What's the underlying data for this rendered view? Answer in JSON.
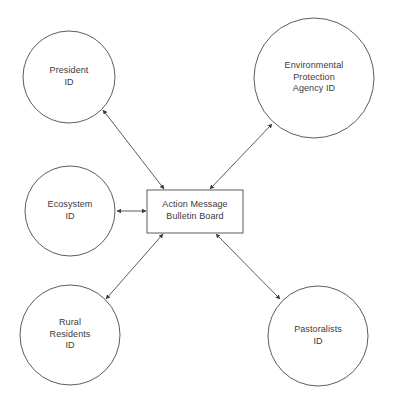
{
  "diagram": {
    "background_color": "#ffffff",
    "stroke_color": "#4a4a4a",
    "text_color": "#3a3a3a",
    "center_node": {
      "id": "action-message-bulletin-board",
      "shape": "rectangle",
      "lines": [
        "Action Message",
        "Bulletin Board"
      ],
      "line1": "Action Message",
      "line2": "Bulletin Board",
      "x": 147,
      "y": 190,
      "width": 96,
      "height": 43
    },
    "nodes": [
      {
        "id": "president-id",
        "shape": "circle",
        "lines": [
          "President",
          "ID"
        ],
        "line1": "President",
        "line2": "ID",
        "cx": 69,
        "cy": 77,
        "r": 46
      },
      {
        "id": "environmental-protection-agency-id",
        "shape": "circle",
        "lines": [
          "Environmental",
          "Protection",
          "Agency ID"
        ],
        "line1": "Environmental",
        "line2": "Protection",
        "line3": "Agency ID",
        "cx": 314,
        "cy": 78,
        "r": 60
      },
      {
        "id": "ecosystem-id",
        "shape": "circle",
        "lines": [
          "Ecosystem",
          "ID"
        ],
        "line1": "Ecosystem",
        "line2": "ID",
        "cx": 70,
        "cy": 211,
        "r": 45
      },
      {
        "id": "rural-residents-id",
        "shape": "circle",
        "lines": [
          "Rural",
          "Residents",
          "ID"
        ],
        "line1": "Rural",
        "line2": "Residents",
        "line3": "ID",
        "cx": 70,
        "cy": 335,
        "r": 50
      },
      {
        "id": "pastoralists-id",
        "shape": "circle",
        "lines": [
          "Pastoralists",
          "ID"
        ],
        "line1": "Pastoralists",
        "line2": "ID",
        "cx": 318,
        "cy": 336,
        "r": 50
      }
    ],
    "connectors": [
      {
        "id": "president-to-board",
        "from": "president-id",
        "to": "action-message-bulletin-board",
        "direction": "bidirectional",
        "x1": 103,
        "y1": 110,
        "x2": 164,
        "y2": 189
      },
      {
        "id": "epa-to-board",
        "from": "environmental-protection-agency-id",
        "to": "action-message-bulletin-board",
        "direction": "bidirectional",
        "x1": 272,
        "y1": 124,
        "x2": 210,
        "y2": 189
      },
      {
        "id": "ecosystem-to-board",
        "from": "ecosystem-id",
        "to": "action-message-bulletin-board",
        "direction": "bidirectional",
        "x1": 116,
        "y1": 211,
        "x2": 146,
        "y2": 211
      },
      {
        "id": "rural-residents-to-board",
        "from": "rural-residents-id",
        "to": "action-message-bulletin-board",
        "direction": "bidirectional",
        "x1": 106,
        "y1": 299,
        "x2": 163,
        "y2": 234
      },
      {
        "id": "pastoralists-to-board",
        "from": "pastoralists-id",
        "to": "action-message-bulletin-board",
        "direction": "bidirectional",
        "x1": 280,
        "y1": 299,
        "x2": 216,
        "y2": 234
      }
    ]
  }
}
